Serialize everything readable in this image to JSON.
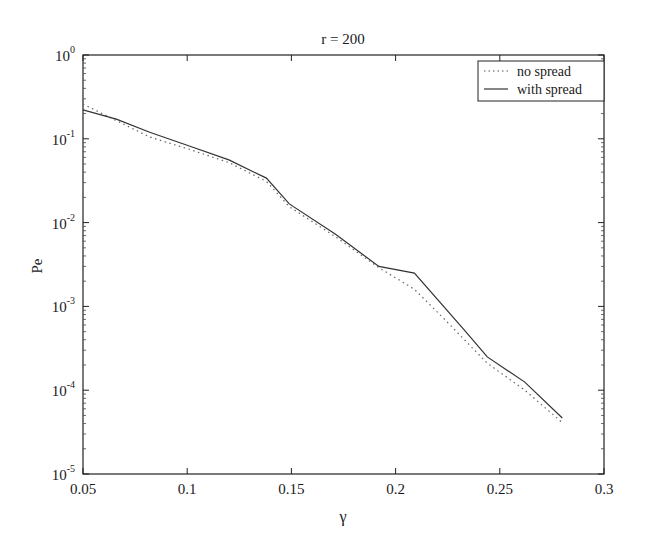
{
  "chart_data": {
    "type": "line",
    "title": "r = 200",
    "xlabel": "γ",
    "ylabel": "Pe",
    "xlim": [
      0.05,
      0.3
    ],
    "ylim": [
      1e-05,
      1
    ],
    "yscale": "log",
    "grid": false,
    "legend_position": "upper right",
    "x_ticks": [
      "0.05",
      "0.1",
      "0.15",
      "0.2",
      "0.25",
      "0.3"
    ],
    "y_ticks": [
      {
        "base": "10",
        "exp": "0"
      },
      {
        "base": "10",
        "exp": "-1"
      },
      {
        "base": "10",
        "exp": "-2"
      },
      {
        "base": "10",
        "exp": "-3"
      },
      {
        "base": "10",
        "exp": "-4"
      },
      {
        "base": "10",
        "exp": "-5"
      }
    ],
    "series": [
      {
        "name": "no spread",
        "style": "dotted",
        "x": [
          0.05,
          0.066,
          0.082,
          0.101,
          0.12,
          0.138,
          0.149,
          0.171,
          0.192,
          0.209,
          0.221,
          0.244,
          0.262,
          0.28
        ],
        "values": [
          0.26,
          0.165,
          0.105,
          0.075,
          0.052,
          0.031,
          0.0155,
          0.0068,
          0.0029,
          0.0016,
          0.00081,
          0.00021,
          0.0001,
          4.1e-05
        ]
      },
      {
        "name": "with spread",
        "style": "solid",
        "x": [
          0.05,
          0.066,
          0.082,
          0.101,
          0.12,
          0.138,
          0.149,
          0.171,
          0.192,
          0.209,
          0.233,
          0.244,
          0.262,
          0.28
        ],
        "values": [
          0.221,
          0.172,
          0.12,
          0.082,
          0.056,
          0.034,
          0.0167,
          0.0073,
          0.003,
          0.0025,
          0.00052,
          0.00025,
          0.000125,
          4.66e-05
        ]
      }
    ]
  }
}
